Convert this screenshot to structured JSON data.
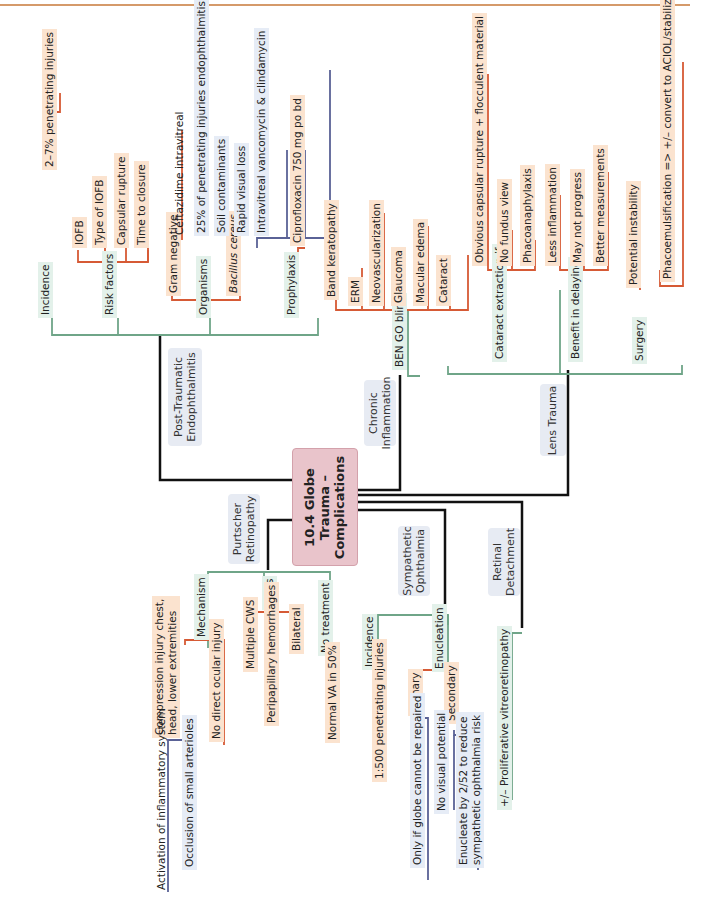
{
  "center": {
    "line1": "10.4 Globe",
    "line2": "Trauma –",
    "line3": "Complications"
  },
  "colors": {
    "main_line": "#111111",
    "green": "#6fa588",
    "orange": "#d65a35",
    "blue": "#5a6296",
    "center_fill": "#e9c4cb",
    "category_fill": "#e7ebf3"
  },
  "branches": {
    "endophthalmitis": {
      "title_line1": "Post-Traumatic",
      "title_line2": "Endophthalmitis",
      "incidence": {
        "label": "Incidence",
        "value": "2–7% penetrating injuries"
      },
      "risk_factors": {
        "label": "Risk factors",
        "items": [
          "IOFB",
          "Type of IOFB",
          "Capsular rupture",
          "Time to closure"
        ]
      },
      "organisms": {
        "label": "Organisms",
        "gram_negative": {
          "label": "Gram negative",
          "treatment": "Ceftazidime intravitreal"
        },
        "bacillus": {
          "label": "Bacillus cereus",
          "items": [
            "25% of penetrating injuries endophthalmitis",
            "Soil contaminants",
            "Rapid visual loss",
            "Intravitreal vancomycin & clindamycin"
          ]
        }
      },
      "prophylaxis": {
        "label": "Prophylaxis",
        "value": "Ciprofloxacin 750 mg po bd"
      }
    },
    "chronic_inflammation": {
      "title_line1": "Chronic",
      "title_line2": "Inflammation",
      "mnemonic": "BEN GO blind",
      "items": [
        "Band keratopathy",
        "ERM",
        "Neovascularization",
        "Glaucoma",
        "Macular edema",
        "Cataract"
      ]
    },
    "lens_trauma": {
      "title": "Lens Trauma",
      "cataract_extraction": {
        "label": "Cataract extraction if",
        "items": [
          "Obvious capsular rupture + flocculent material",
          "No fundus view",
          "Phacoanaphylaxis"
        ]
      },
      "benefit_delaying": {
        "label": "Benefit in delaying",
        "items": [
          "Less inflammation",
          "May not progress",
          "Better measurements"
        ]
      },
      "surgery": {
        "label": "Surgery",
        "items": [
          "Potential instability",
          "Phacoemulsification => +/– convert to ACIOL/stabilized PCIOL"
        ]
      }
    },
    "purtscher": {
      "title_line1": "Purtscher",
      "title_line2": "Retinopathy",
      "mechanism": {
        "label": "Mechanism",
        "compression": "Compression injury chest,\nhead, lower extremities",
        "compression_l1": "Compression injury chest,",
        "compression_l2": "head, lower extremities",
        "items": [
          "Activation of inflammatory system",
          "Occlusion of small arterioles"
        ],
        "no_direct": "No direct ocular injury"
      },
      "signs": {
        "label": "Signs",
        "items": [
          "Multiple CWS",
          "Peripapillary hemorrhages",
          "Bilateral"
        ]
      },
      "no_treatment": {
        "label": "No treatment",
        "value": "Normal VA in 50%"
      }
    },
    "sympathetic": {
      "title_line1": "Sympathetic",
      "title_line2": "Ophthalmia",
      "incidence": {
        "label": "Incidence",
        "value": "1:500 penetrating injuries"
      },
      "enucleation": {
        "label": "Enucleation",
        "primary": {
          "label": "Primary",
          "value": "Only if globe cannot be repaired"
        },
        "secondary": {
          "label": "Secondary",
          "items": [
            "No visual potential"
          ],
          "reduce_l1": "Enucleate by 2/52 to reduce",
          "reduce_l2": "sympathetic ophthalmia risk"
        }
      }
    },
    "retinal_detachment": {
      "title_line1": "Retinal",
      "title_line2": "Detachment",
      "value": "+/– Proliferative vitreoretinopathy"
    }
  }
}
